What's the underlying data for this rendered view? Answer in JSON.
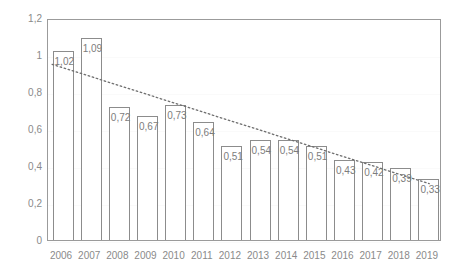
{
  "chart_data": {
    "type": "bar",
    "title": "",
    "subtitle": "",
    "xlabel": "",
    "ylabel": "",
    "categories": [
      "2006",
      "2007",
      "2008",
      "2009",
      "2010",
      "2011",
      "2012",
      "2013",
      "2014",
      "2015",
      "2016",
      "2017",
      "2018",
      "2019"
    ],
    "values": [
      1.02,
      1.09,
      0.72,
      0.67,
      0.73,
      0.64,
      0.51,
      0.54,
      0.54,
      0.51,
      0.43,
      0.42,
      0.39,
      0.33
    ],
    "data_labels": [
      "1,02",
      "1,09",
      "0,72",
      "0,67",
      "0,73",
      "0,64",
      "0,51",
      "0,54",
      "0,54",
      "0,51",
      "0,43",
      "0,42",
      "0,39",
      "0,33"
    ],
    "ylim": [
      0,
      1.2
    ],
    "ytick_values": [
      0,
      0.2,
      0.4,
      0.6,
      0.8,
      1.0,
      1.2
    ],
    "ytick_labels": [
      "0",
      "0,2",
      "0,4",
      "0,6",
      "0,8",
      "1",
      "1,2"
    ],
    "grid": true,
    "legend": "none",
    "series": [
      {
        "name": "bars",
        "style": "bar-outline",
        "values": [
          1.02,
          1.09,
          0.72,
          0.67,
          0.73,
          0.64,
          0.51,
          0.54,
          0.54,
          0.51,
          0.43,
          0.42,
          0.39,
          0.33
        ]
      },
      {
        "name": "trendline",
        "style": "dotted-linear",
        "start_value": 0.955,
        "end_value": 0.31
      }
    ],
    "decimal_separator": ",",
    "colors": {
      "bar_outline": "#8c8c8c",
      "bar_fill": "#ffffff",
      "trendline": "#6e6e6e",
      "axis_text": "#8a8a8a",
      "label_text": "#7d7d7d",
      "plot_border": "#9b9b9b",
      "background": "#ffffff"
    }
  }
}
